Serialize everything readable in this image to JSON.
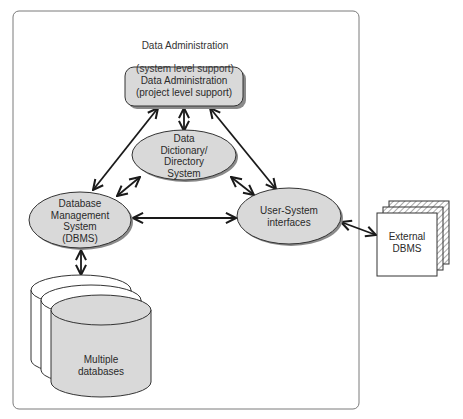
{
  "diagram": {
    "title": {
      "line1": "Data Administration",
      "line2": "(system level support)"
    },
    "nodes": {
      "project_admin": {
        "label": "Data Administration\n(project level support)",
        "shape": "rounded-rect",
        "fill": "#d9d9d9"
      },
      "data_dictionary": {
        "label": "Data\nDictionary/\nDirectory\nSystem",
        "shape": "ellipse",
        "fill": "#d9d9d9"
      },
      "dbms": {
        "label": "Database\nManagement\nSystem\n(DBMS)",
        "shape": "ellipse",
        "fill": "#d9d9d9"
      },
      "user_system": {
        "label": "User-System\ninterfaces",
        "shape": "ellipse",
        "fill": "#d9d9d9"
      },
      "databases": {
        "label": "Multiple\ndatabases",
        "shape": "stacked-cylinders",
        "fill": "#d9d9d9"
      },
      "external_dbms": {
        "label": "External\nDBMS",
        "shape": "stacked-pages",
        "fill": "#ffffff"
      }
    },
    "edges": [
      {
        "from": "project_admin",
        "to": "data_dictionary",
        "type": "bidirectional"
      },
      {
        "from": "project_admin",
        "to": "dbms",
        "type": "bidirectional"
      },
      {
        "from": "project_admin",
        "to": "user_system",
        "type": "bidirectional"
      },
      {
        "from": "data_dictionary",
        "to": "dbms",
        "type": "bidirectional"
      },
      {
        "from": "data_dictionary",
        "to": "user_system",
        "type": "bidirectional"
      },
      {
        "from": "dbms",
        "to": "user_system",
        "type": "bidirectional"
      },
      {
        "from": "dbms",
        "to": "databases",
        "type": "bidirectional"
      },
      {
        "from": "user_system",
        "to": "external_dbms",
        "type": "bidirectional"
      }
    ],
    "colors": {
      "node_fill": "#d9d9d9",
      "stroke": "#1a1a1a",
      "frame": "#777777"
    }
  }
}
